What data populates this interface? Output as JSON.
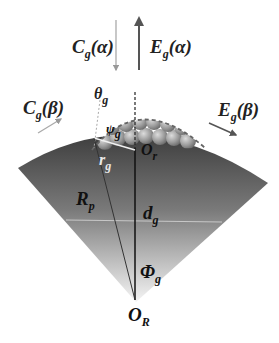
{
  "figure": {
    "colors": {
      "sector_top": "#4a4a4a",
      "sector_bottom": "#f2f2f2",
      "sphere": "#9a9a9a",
      "arrow": "#aaaaaa",
      "line": "#222222"
    }
  },
  "labels": {
    "c_alpha": {
      "main": "C",
      "sub": "g",
      "arg": "(α)"
    },
    "e_alpha": {
      "main": "E",
      "sub": "g",
      "arg": "(α)"
    },
    "c_beta": {
      "main": "C",
      "sub": "g",
      "arg": "(β)"
    },
    "e_beta": {
      "main": "E",
      "sub": "g",
      "arg": "(β)"
    },
    "theta": {
      "main": "θ",
      "sub": "g"
    },
    "psi": {
      "main": "ψ",
      "sub": "g"
    },
    "o_r": {
      "main": "O",
      "sub": "r"
    },
    "r_g": {
      "main": "r",
      "sub": "g"
    },
    "R_p": {
      "main": "R",
      "sub": "p"
    },
    "d_g": {
      "main": "d",
      "sub": "g"
    },
    "phi": {
      "main": "Φ",
      "sub": "g"
    },
    "o_R": {
      "main": "O",
      "sub": "R"
    }
  }
}
